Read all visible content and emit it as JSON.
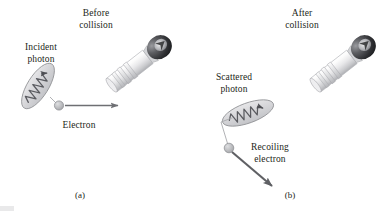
{
  "figure": {
    "width": 387,
    "height": 213,
    "background": "#ffffff"
  },
  "colors": {
    "text": "#231f20",
    "photon_fill": "#d8d8da",
    "photon_stroke": "#8f9094",
    "wave_stroke": "#5a5b60",
    "electron_fill": "#b9babd",
    "electron_stroke": "#8a8b8f",
    "arrow": "#6e6f73",
    "recoil_arrow": "#5f6064",
    "device_light": "#f2f2f3",
    "device_mid": "#cfd0d2",
    "device_dark": "#3a3a3c"
  },
  "panels": [
    {
      "id": "a",
      "caption": "(a)",
      "heading": "Before\ncollision",
      "labels": [
        {
          "name": "incident-photon-label",
          "text": "Incident\nphoton"
        },
        {
          "name": "electron-label",
          "text": "Electron"
        }
      ],
      "elements": [
        {
          "name": "incident-photon",
          "kind": "photon-packet",
          "tilt_deg": -58,
          "wave_direction": "down-right"
        },
        {
          "name": "electron-particle",
          "kind": "particle"
        },
        {
          "name": "electron-velocity-arrow",
          "kind": "arrow",
          "direction": "right"
        },
        {
          "name": "detector-device",
          "kind": "device",
          "tilt_deg": -38
        }
      ]
    },
    {
      "id": "b",
      "caption": "(b)",
      "heading": "After\ncollision",
      "labels": [
        {
          "name": "scattered-photon-label",
          "text": "Scattered\nphoton"
        },
        {
          "name": "recoiling-electron-label",
          "text": "Recoiling\nelectron"
        }
      ],
      "elements": [
        {
          "name": "scattered-photon",
          "kind": "photon-packet",
          "tilt_deg": -20,
          "wave_direction": "up-right"
        },
        {
          "name": "photon-path-line",
          "kind": "line"
        },
        {
          "name": "recoiling-electron-particle",
          "kind": "particle"
        },
        {
          "name": "recoil-velocity-arrow",
          "kind": "arrow",
          "direction": "down-right"
        },
        {
          "name": "detector-device",
          "kind": "device",
          "tilt_deg": -38
        }
      ]
    }
  ],
  "text": {
    "panel_a": {
      "heading": "Before\ncollision",
      "incident_photon": "Incident\nphoton",
      "electron": "Electron",
      "caption": "(a)"
    },
    "panel_b": {
      "heading": "After\ncollision",
      "scattered_photon": "Scattered\nphoton",
      "recoiling_electron": "Recoiling\nelectron",
      "caption": "(b)"
    }
  }
}
